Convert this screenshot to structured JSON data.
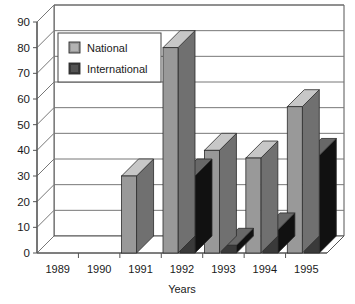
{
  "chart_data": {
    "type": "bar",
    "title": "",
    "subtitle": "",
    "xlabel": "Years",
    "ylabel": "",
    "categories": [
      "1989",
      "1990",
      "1991",
      "1992",
      "1993",
      "1994",
      "1995"
    ],
    "series": [
      {
        "name": "National",
        "values": [
          0,
          0,
          30,
          80,
          40,
          37,
          57
        ],
        "color": "#999999"
      },
      {
        "name": "International",
        "values": [
          0,
          0,
          0,
          30,
          3,
          9,
          38
        ],
        "color": "#3a3a3a"
      }
    ],
    "ylim": [
      0,
      90
    ],
    "yticks": [
      "0",
      "10",
      "20",
      "30",
      "40",
      "50",
      "60",
      "70",
      "80",
      "90"
    ],
    "ytick_values": [
      0,
      10,
      20,
      30,
      40,
      50,
      60,
      70,
      80,
      90
    ],
    "grid": true,
    "grid_axis": "y",
    "legend_position": "top-left-inside",
    "style": "3d-column",
    "background": "#ffffff",
    "axis_color": "#555555",
    "grid_color": "#777777",
    "text_color": "#1a1a1a"
  },
  "legend": {
    "items": [
      {
        "label": "National",
        "swatch": "#999999"
      },
      {
        "label": "International",
        "swatch": "#3a3a3a"
      }
    ]
  }
}
